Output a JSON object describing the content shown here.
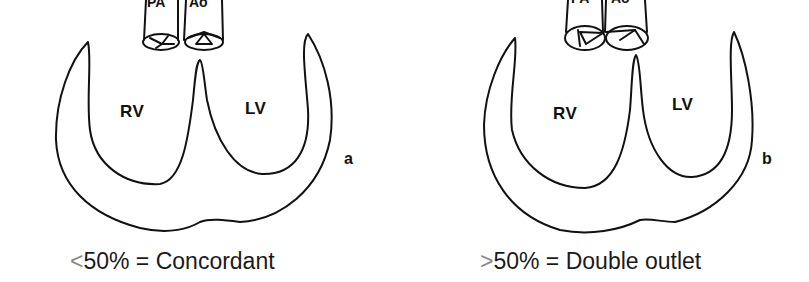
{
  "figure": {
    "panels": [
      {
        "id": "a",
        "letter": "a",
        "vessels": {
          "left": "PA",
          "right": "Ao"
        },
        "chambers": {
          "right": "RV",
          "left": "LV"
        },
        "caption": {
          "symbol": "<",
          "text": "50% = Concordant"
        }
      },
      {
        "id": "b",
        "letter": "b",
        "vessels": {
          "left": "PA",
          "right": "Ao"
        },
        "chambers": {
          "right": "RV",
          "left": "LV"
        },
        "caption": {
          "symbol": ">",
          "text": "50% = Double outlet"
        }
      }
    ]
  }
}
